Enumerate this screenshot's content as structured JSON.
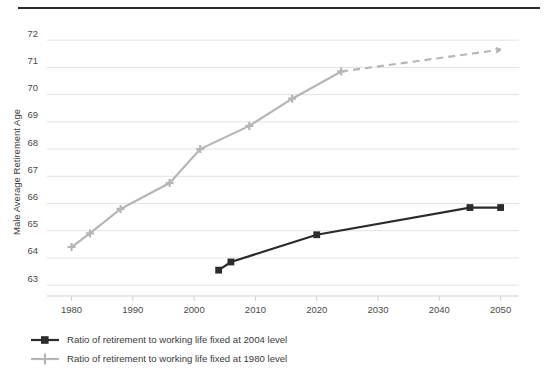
{
  "chart_data": {
    "type": "line",
    "title": "",
    "xlabel": "",
    "ylabel": "Male Average Retirement Age",
    "xlim": [
      1976,
      2053
    ],
    "ylim": [
      62.6,
      72.3
    ],
    "xticks": [
      1980,
      1990,
      2000,
      2010,
      2020,
      2030,
      2040,
      2050
    ],
    "yticks": [
      63,
      64,
      65,
      66,
      67,
      68,
      69,
      70,
      71,
      72
    ],
    "grid": true,
    "legend_position": "below-plot-left",
    "series": [
      {
        "name": "Ratio of retirement to working life fixed at 2004 level",
        "color": "#2b2b2b",
        "marker": "square",
        "linestyle": "solid",
        "x": [
          2004,
          2006,
          2020,
          2045,
          2050
        ],
        "y": [
          63.55,
          63.85,
          64.85,
          65.85,
          65.85
        ]
      },
      {
        "name": "Ratio of retirement to working life fixed at 1980 level",
        "color": "#b6b6b6",
        "marker": "plus",
        "linestyle": "solid-then-dashed",
        "dash_starts_at": 2024,
        "x": [
          1980,
          1983,
          1988,
          1996,
          2001,
          2009,
          2016,
          2024,
          2050
        ],
        "y": [
          64.4,
          64.9,
          65.8,
          66.75,
          68.0,
          68.85,
          69.85,
          70.85,
          71.65
        ]
      }
    ]
  },
  "axis": {
    "y_title": "Male Average Retirement Age",
    "y_tick_labels": [
      "72",
      "71",
      "70",
      "69",
      "68",
      "67",
      "66",
      "65",
      "64",
      "63"
    ],
    "x_tick_labels": [
      "1980",
      "1990",
      "2000",
      "2010",
      "2020",
      "2030",
      "2040",
      "2050"
    ]
  },
  "legend": {
    "items": [
      {
        "label": "Ratio of retirement to working life fixed at 2004 level",
        "color": "#2b2b2b",
        "marker": "square-marker"
      },
      {
        "label": "Ratio of retirement to working life fixed at 1980 level",
        "color": "#b6b6b6",
        "marker": "plus-marker"
      }
    ]
  },
  "colors": {
    "series_dark": "#2b2b2b",
    "series_light": "#b6b6b6",
    "gridline": "#e2e2e2",
    "axis": "#cfcfcf",
    "text": "#3a3a3a",
    "rule": "#2b2b2b"
  }
}
